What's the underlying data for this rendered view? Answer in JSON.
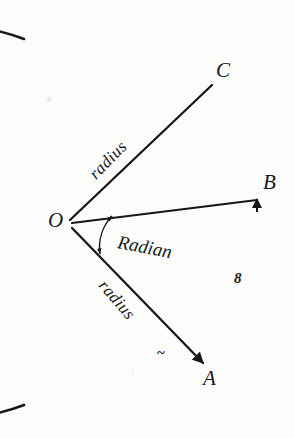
{
  "figure": {
    "background_color": "#fcfcfa",
    "ink_color": "#17171a",
    "stroke_width": 2.4
  },
  "geometry": {
    "center": {
      "x": 66,
      "y": 222
    },
    "radius": 196,
    "arc_start_deg": 118,
    "arc_end_deg": -118
  },
  "points": [
    {
      "id": "O",
      "label": "O",
      "x": 66,
      "y": 222,
      "label_x": 48,
      "label_y": 211
    },
    {
      "id": "A",
      "label": "A",
      "x": 203,
      "y": 364,
      "label_x": 202,
      "label_y": 370
    },
    {
      "id": "B",
      "label": "B",
      "x": 259,
      "y": 197,
      "label_x": 262,
      "label_y": 174
    },
    {
      "id": "C",
      "label": "C",
      "x": 212,
      "y": 84,
      "label_x": 215,
      "label_y": 61
    }
  ],
  "segments": [
    {
      "id": "OC",
      "from": "O",
      "to": "C",
      "label": "radius"
    },
    {
      "id": "OB",
      "from": "O",
      "to": "B",
      "label": "",
      "arrowhead": true
    },
    {
      "id": "OA",
      "from": "O",
      "to": "A",
      "label": "radius",
      "arrowhead": true
    }
  ],
  "labels": {
    "radius_upper": {
      "text": "radius",
      "x": 96,
      "y": 172,
      "rotation_deg": -46
    },
    "radius_lower": {
      "text": "radius",
      "x": 104,
      "y": 277,
      "rotation_deg": 49
    },
    "radian": {
      "text": "Radian",
      "x": 118,
      "y": 240,
      "rotation_deg": 11
    },
    "arc_length": {
      "text": "8",
      "x": 234,
      "y": 272
    },
    "tilde_mark": {
      "text": "~",
      "x": 158,
      "y": 346
    }
  },
  "angle_arrow": {
    "name": "radian-angle-arc",
    "radius": 45,
    "from_deg": -8,
    "to_deg": 46,
    "double_headed": true
  }
}
